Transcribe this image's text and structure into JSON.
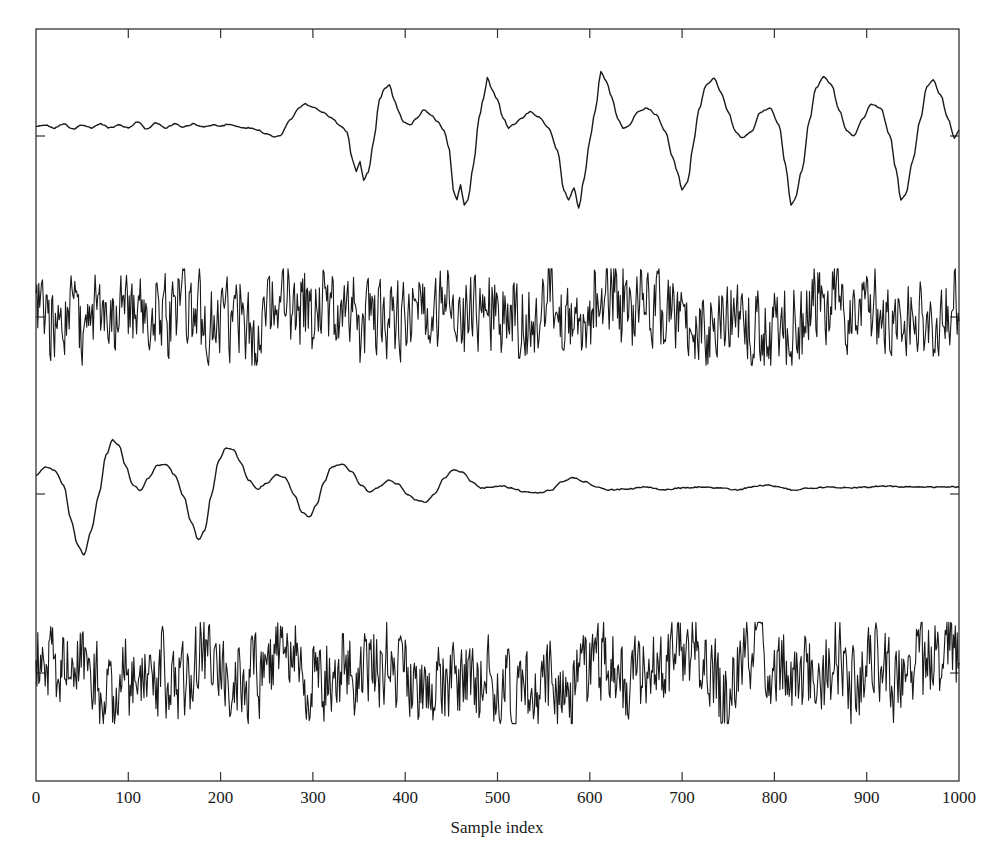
{
  "chart_data": {
    "type": "line",
    "title": "",
    "xlabel": "Sample index",
    "ylabel": "",
    "xlim": [
      0,
      1000
    ],
    "xticks": [
      0,
      100,
      200,
      300,
      400,
      500,
      600,
      700,
      800,
      900,
      1000
    ],
    "xtick_labels": [
      "0",
      "100",
      "200",
      "300",
      "400",
      "500",
      "600",
      "700",
      "800",
      "900",
      "1000"
    ],
    "grid": false,
    "legend": null,
    "layout": {
      "plot_left_px": 36,
      "plot_right_px": 959,
      "plot_top_px": 29,
      "plot_bottom_px": 781,
      "line_color": "#1a1a1a",
      "axis_color": "#333333"
    },
    "series": [
      {
        "name": "trace-1 (quasi-periodic, onset ~250)",
        "baseline_px": 136,
        "style": "keypoints",
        "keypoints_sample_pixel_y": [
          [
            0,
            127
          ],
          [
            10,
            125
          ],
          [
            20,
            128
          ],
          [
            30,
            124
          ],
          [
            40,
            129
          ],
          [
            50,
            125
          ],
          [
            60,
            128
          ],
          [
            70,
            124
          ],
          [
            80,
            128
          ],
          [
            90,
            125
          ],
          [
            100,
            128
          ],
          [
            110,
            122
          ],
          [
            120,
            129
          ],
          [
            130,
            123
          ],
          [
            140,
            128
          ],
          [
            150,
            124
          ],
          [
            160,
            127
          ],
          [
            170,
            124
          ],
          [
            180,
            127
          ],
          [
            190,
            125
          ],
          [
            200,
            126
          ],
          [
            210,
            124
          ],
          [
            220,
            127
          ],
          [
            230,
            128
          ],
          [
            240,
            130
          ],
          [
            250,
            134
          ],
          [
            258,
            137
          ],
          [
            265,
            135
          ],
          [
            275,
            120
          ],
          [
            285,
            108
          ],
          [
            292,
            104
          ],
          [
            300,
            107
          ],
          [
            310,
            112
          ],
          [
            320,
            118
          ],
          [
            330,
            126
          ],
          [
            337,
            132
          ],
          [
            343,
            160
          ],
          [
            347,
            172
          ],
          [
            351,
            162
          ],
          [
            355,
            180
          ],
          [
            360,
            172
          ],
          [
            366,
            140
          ],
          [
            372,
            100
          ],
          [
            378,
            88
          ],
          [
            383,
            85
          ],
          [
            388,
            100
          ],
          [
            393,
            112
          ],
          [
            398,
            122
          ],
          [
            405,
            125
          ],
          [
            413,
            118
          ],
          [
            420,
            110
          ],
          [
            428,
            115
          ],
          [
            435,
            122
          ],
          [
            442,
            130
          ],
          [
            448,
            150
          ],
          [
            452,
            190
          ],
          [
            456,
            200
          ],
          [
            460,
            185
          ],
          [
            464,
            205
          ],
          [
            468,
            200
          ],
          [
            474,
            165
          ],
          [
            480,
            118
          ],
          [
            485,
            98
          ],
          [
            489,
            78
          ],
          [
            494,
            90
          ],
          [
            500,
            100
          ],
          [
            506,
            118
          ],
          [
            512,
            128
          ],
          [
            518,
            124
          ],
          [
            526,
            118
          ],
          [
            535,
            112
          ],
          [
            545,
            117
          ],
          [
            555,
            128
          ],
          [
            565,
            150
          ],
          [
            572,
            190
          ],
          [
            577,
            200
          ],
          [
            583,
            188
          ],
          [
            588,
            208
          ],
          [
            594,
            178
          ],
          [
            600,
            140
          ],
          [
            606,
            110
          ],
          [
            612,
            72
          ],
          [
            618,
            82
          ],
          [
            624,
            98
          ],
          [
            630,
            118
          ],
          [
            636,
            128
          ],
          [
            642,
            126
          ],
          [
            652,
            112
          ],
          [
            662,
            108
          ],
          [
            672,
            115
          ],
          [
            682,
            132
          ],
          [
            690,
            158
          ],
          [
            695,
            172
          ],
          [
            700,
            190
          ],
          [
            706,
            182
          ],
          [
            712,
            145
          ],
          [
            718,
            110
          ],
          [
            726,
            85
          ],
          [
            735,
            78
          ],
          [
            742,
            92
          ],
          [
            750,
            112
          ],
          [
            758,
            132
          ],
          [
            765,
            138
          ],
          [
            775,
            132
          ],
          [
            785,
            112
          ],
          [
            795,
            108
          ],
          [
            805,
            125
          ],
          [
            812,
            165
          ],
          [
            818,
            205
          ],
          [
            822,
            200
          ],
          [
            830,
            170
          ],
          [
            838,
            120
          ],
          [
            845,
            88
          ],
          [
            853,
            77
          ],
          [
            862,
            85
          ],
          [
            870,
            110
          ],
          [
            878,
            130
          ],
          [
            886,
            136
          ],
          [
            896,
            118
          ],
          [
            905,
            104
          ],
          [
            915,
            108
          ],
          [
            925,
            135
          ],
          [
            932,
            170
          ],
          [
            937,
            200
          ],
          [
            942,
            195
          ],
          [
            950,
            160
          ],
          [
            958,
            120
          ],
          [
            965,
            87
          ],
          [
            972,
            80
          ],
          [
            980,
            95
          ],
          [
            988,
            118
          ],
          [
            995,
            138
          ],
          [
            1000,
            130
          ]
        ]
      },
      {
        "name": "trace-2 (broadband noise)",
        "baseline_px": 317,
        "style": "noise",
        "amplitude_px": 42,
        "seed": 17,
        "points": 1000
      },
      {
        "name": "trace-3 (decaying oscillation)",
        "baseline_px": 494,
        "style": "keypoints",
        "keypoints_sample_pixel_y": [
          [
            0,
            476
          ],
          [
            10,
            467
          ],
          [
            20,
            470
          ],
          [
            30,
            485
          ],
          [
            38,
            520
          ],
          [
            45,
            545
          ],
          [
            52,
            555
          ],
          [
            60,
            530
          ],
          [
            68,
            495
          ],
          [
            76,
            455
          ],
          [
            83,
            440
          ],
          [
            90,
            445
          ],
          [
            97,
            466
          ],
          [
            105,
            485
          ],
          [
            113,
            490
          ],
          [
            122,
            478
          ],
          [
            132,
            465
          ],
          [
            142,
            465
          ],
          [
            150,
            475
          ],
          [
            160,
            496
          ],
          [
            168,
            522
          ],
          [
            176,
            540
          ],
          [
            183,
            530
          ],
          [
            190,
            495
          ],
          [
            198,
            460
          ],
          [
            206,
            448
          ],
          [
            214,
            450
          ],
          [
            222,
            463
          ],
          [
            230,
            480
          ],
          [
            240,
            489
          ],
          [
            250,
            483
          ],
          [
            260,
            475
          ],
          [
            270,
            478
          ],
          [
            280,
            495
          ],
          [
            288,
            512
          ],
          [
            296,
            517
          ],
          [
            304,
            505
          ],
          [
            312,
            482
          ],
          [
            320,
            467
          ],
          [
            332,
            464
          ],
          [
            342,
            472
          ],
          [
            352,
            485
          ],
          [
            362,
            492
          ],
          [
            372,
            487
          ],
          [
            382,
            480
          ],
          [
            392,
            484
          ],
          [
            402,
            494
          ],
          [
            412,
            500
          ],
          [
            422,
            502
          ],
          [
            432,
            494
          ],
          [
            442,
            478
          ],
          [
            452,
            470
          ],
          [
            462,
            472
          ],
          [
            472,
            482
          ],
          [
            482,
            488
          ],
          [
            495,
            487
          ],
          [
            505,
            486
          ],
          [
            515,
            488
          ],
          [
            530,
            492
          ],
          [
            545,
            493
          ],
          [
            558,
            490
          ],
          [
            570,
            482
          ],
          [
            582,
            478
          ],
          [
            595,
            482
          ],
          [
            608,
            487
          ],
          [
            620,
            490
          ],
          [
            640,
            489
          ],
          [
            660,
            487
          ],
          [
            680,
            490
          ],
          [
            700,
            488
          ],
          [
            720,
            487
          ],
          [
            740,
            488
          ],
          [
            760,
            490
          ],
          [
            775,
            487
          ],
          [
            790,
            485
          ],
          [
            805,
            487
          ],
          [
            820,
            490
          ],
          [
            840,
            488
          ],
          [
            860,
            487
          ],
          [
            880,
            488
          ],
          [
            900,
            487
          ],
          [
            920,
            486
          ],
          [
            940,
            487
          ],
          [
            960,
            487
          ],
          [
            1000,
            487
          ]
        ]
      },
      {
        "name": "trace-4 (broadband noise)",
        "baseline_px": 673,
        "style": "noise",
        "amplitude_px": 44,
        "seed": 91,
        "points": 1000
      }
    ]
  }
}
